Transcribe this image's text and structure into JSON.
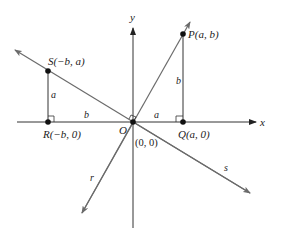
{
  "diagram": {
    "type": "coordinate-geometry",
    "colors": {
      "axis": "#333333",
      "line": "#6b6b6b",
      "point": "#111111",
      "text": "#222222"
    },
    "axes": {
      "x_label": "x",
      "y_label": "y"
    },
    "origin": {
      "label": "O",
      "coord_label": "(0, 0)"
    },
    "points": [
      {
        "id": "P",
        "label": "P(a, b)"
      },
      {
        "id": "Q",
        "label": "Q(a, 0)"
      },
      {
        "id": "R",
        "label": "R(−b, 0)"
      },
      {
        "id": "S",
        "label": "S(−b, a)"
      }
    ],
    "segments": {
      "PQ_length": "b",
      "OQ_length": "a",
      "SR_length": "a",
      "RO_length": "b"
    },
    "lines": {
      "r": "r",
      "s": "s"
    }
  }
}
